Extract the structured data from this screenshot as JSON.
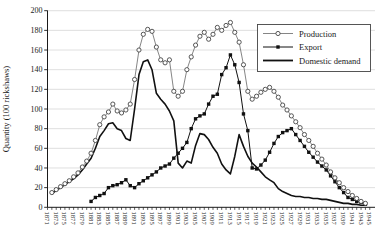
{
  "page": {
    "background": "#ffffff"
  },
  "chart_data": {
    "type": "line",
    "title": "",
    "xlabel": "",
    "ylabel": "Quantity (100 rickshaws)",
    "ylim": [
      0,
      200
    ],
    "yticks": [
      0,
      20,
      40,
      60,
      80,
      100,
      120,
      140,
      160,
      180,
      200
    ],
    "x_label_every": 2,
    "grid": "horizontal-light",
    "gridline_color": "#c9c9c9",
    "axis_color": "#1a1a1a",
    "legend": {
      "position": "top-right",
      "border": true
    },
    "x": [
      1871,
      1872,
      1873,
      1874,
      1875,
      1876,
      1877,
      1878,
      1879,
      1880,
      1881,
      1882,
      1883,
      1884,
      1885,
      1886,
      1887,
      1888,
      1889,
      1890,
      1891,
      1892,
      1893,
      1894,
      1895,
      1896,
      1897,
      1898,
      1899,
      1900,
      1901,
      1902,
      1903,
      1904,
      1905,
      1906,
      1907,
      1908,
      1909,
      1910,
      1911,
      1912,
      1913,
      1914,
      1915,
      1916,
      1917,
      1918,
      1919,
      1920,
      1921,
      1922,
      1923,
      1924,
      1925,
      1926,
      1927,
      1928,
      1929,
      1930,
      1931,
      1932,
      1933,
      1934,
      1935,
      1936,
      1937,
      1938,
      1939,
      1940,
      1941,
      1942,
      1943,
      1944,
      1945
    ],
    "series": [
      {
        "name": "Production",
        "marker": "open-circle",
        "line_color": "#666666",
        "marker_color": "#444444",
        "values": [
          null,
          15,
          18,
          21,
          24,
          27,
          31,
          35,
          41,
          47,
          55,
          68,
          84,
          92,
          97,
          105,
          98,
          96,
          99,
          105,
          130,
          160,
          176,
          181,
          179,
          163,
          150,
          147,
          150,
          118,
          113,
          118,
          140,
          153,
          165,
          174,
          178,
          171,
          176,
          183,
          180,
          185,
          188,
          178,
          168,
          145,
          118,
          110,
          113,
          117,
          120,
          122,
          118,
          112,
          104,
          99,
          93,
          87,
          81,
          74,
          68,
          62,
          55,
          49,
          43,
          36,
          30,
          25,
          20,
          16,
          12,
          9,
          6,
          4,
          null
        ]
      },
      {
        "name": "Export",
        "marker": "filled-square",
        "line_color": "#111111",
        "marker_color": "#111111",
        "values": [
          null,
          null,
          null,
          null,
          null,
          null,
          null,
          null,
          null,
          null,
          6,
          10,
          12,
          14,
          20,
          22,
          23,
          25,
          28,
          22,
          20,
          24,
          27,
          30,
          33,
          36,
          40,
          42,
          44,
          50,
          55,
          60,
          66,
          80,
          90,
          93,
          95,
          105,
          113,
          115,
          135,
          142,
          155,
          145,
          127,
          95,
          78,
          40,
          39,
          43,
          48,
          56,
          65,
          72,
          76,
          78,
          80,
          74,
          68,
          62,
          56,
          51,
          46,
          42,
          38,
          32,
          26,
          20,
          15,
          10,
          8,
          6,
          5,
          3,
          null
        ]
      },
      {
        "name": "Domestic demand",
        "marker": "none",
        "line_color": "#111111",
        "marker_color": "#111111",
        "values": [
          null,
          14,
          17,
          20,
          23,
          26,
          29,
          33,
          38,
          44,
          50,
          60,
          72,
          78,
          85,
          86,
          80,
          78,
          70,
          68,
          100,
          135,
          148,
          150,
          140,
          116,
          110,
          105,
          98,
          88,
          45,
          40,
          47,
          45,
          63,
          75,
          74,
          69,
          61,
          55,
          44,
          38,
          34,
          52,
          74,
          62,
          52,
          45,
          41,
          36,
          31,
          28,
          25,
          19,
          16,
          14,
          12,
          11,
          11,
          10,
          10,
          9,
          9,
          8,
          8,
          7,
          6,
          5,
          4,
          4,
          3,
          3,
          2,
          2,
          null
        ]
      }
    ]
  }
}
